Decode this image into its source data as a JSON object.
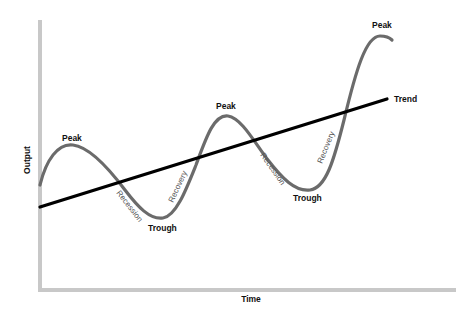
{
  "diagram": {
    "x_axis_label": "Time",
    "y_axis_label": "Output",
    "trend_label": "Trend",
    "labels": {
      "peak_1": "Peak",
      "peak_2": "Peak",
      "peak_3": "Peak",
      "trough_1": "Trough",
      "trough_2": "Trough",
      "recession_1": "Recession",
      "recession_2": "Recession",
      "recovery_1": "Recovery",
      "recovery_2": "Recovery"
    },
    "colors": {
      "cycle_curve": "#6b6b6b",
      "trend_line": "#000000",
      "axes": "#c8c8c8",
      "text": "#111111"
    }
  }
}
